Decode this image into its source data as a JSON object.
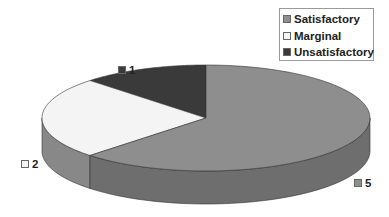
{
  "chart_data": {
    "type": "pie",
    "style": "3d",
    "title": "",
    "categories": [
      "Satisfactory",
      "Marginal",
      "Unsatisfactory"
    ],
    "values": [
      5,
      2,
      1
    ],
    "data_labels": [
      "5",
      "2",
      "1"
    ],
    "colors": {
      "Satisfactory": "#8e8e8e",
      "Marginal": "#f4f4f4",
      "Unsatisfactory": "#3a3a3a"
    },
    "side_colors": {
      "Satisfactory": "#6e6e6e",
      "Marginal": "#888888",
      "Unsatisfactory": "#3a3a3a"
    },
    "legend": {
      "position": "top-right",
      "entries": [
        "Satisfactory",
        "Marginal",
        "Unsatisfactory"
      ]
    }
  },
  "legend": {
    "items": [
      {
        "label": "Satisfactory",
        "color": "#8e8e8e"
      },
      {
        "label": "Marginal",
        "color": "#f4f4f4"
      },
      {
        "label": "Unsatisfactory",
        "color": "#3a3a3a"
      }
    ]
  },
  "labels": {
    "unsatisfactory": "1",
    "marginal": "2",
    "satisfactory": "5"
  }
}
